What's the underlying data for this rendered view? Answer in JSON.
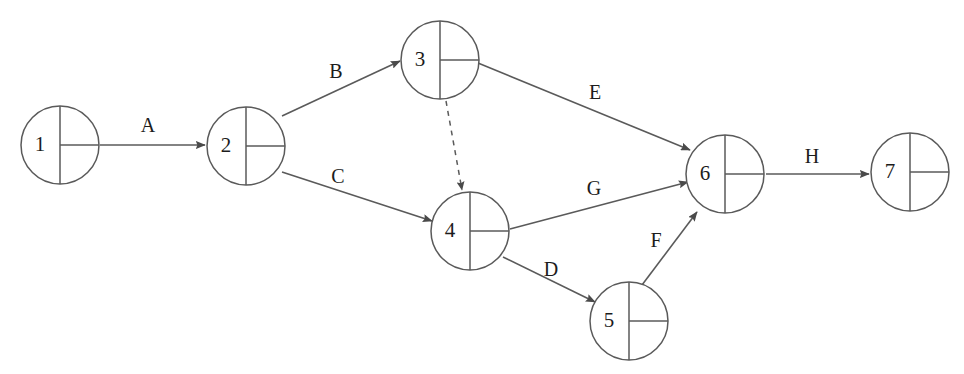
{
  "diagram": {
    "type": "activity-on-arrow-network",
    "background_color": "#ffffff",
    "stroke_color": "#5a5a5a",
    "text_color": "#1c1c1c",
    "nodes": [
      {
        "id": "1",
        "label": "1",
        "cx": 60,
        "cy": 145,
        "r": 39
      },
      {
        "id": "2",
        "label": "2",
        "cx": 246,
        "cy": 146,
        "r": 39
      },
      {
        "id": "3",
        "label": "3",
        "cx": 440,
        "cy": 60,
        "r": 39
      },
      {
        "id": "4",
        "label": "4",
        "cx": 470,
        "cy": 231,
        "r": 39
      },
      {
        "id": "5",
        "label": "5",
        "cx": 629,
        "cy": 321,
        "r": 39
      },
      {
        "id": "6",
        "label": "6",
        "cx": 725,
        "cy": 174,
        "r": 39
      },
      {
        "id": "7",
        "label": "7",
        "cx": 910,
        "cy": 172,
        "r": 39
      }
    ],
    "edges": [
      {
        "id": "A",
        "label": "A",
        "from": "1",
        "to": "2",
        "style": "solid",
        "x1": 100,
        "y1": 145,
        "x2": 205,
        "y2": 145,
        "label_x": 148,
        "label_y": 127
      },
      {
        "id": "B",
        "label": "B",
        "from": "2",
        "to": "3",
        "style": "solid",
        "x1": 282,
        "y1": 116,
        "x2": 400,
        "y2": 61,
        "label_x": 336,
        "label_y": 73
      },
      {
        "id": "C",
        "label": "C",
        "from": "2",
        "to": "4",
        "style": "solid",
        "x1": 282,
        "y1": 172,
        "x2": 432,
        "y2": 221,
        "label_x": 338,
        "label_y": 178
      },
      {
        "id": "dummy",
        "label": "",
        "from": "3",
        "to": "4",
        "style": "dashed",
        "x1": 446,
        "y1": 101,
        "x2": 462,
        "y2": 190,
        "label_x": 0,
        "label_y": 0
      },
      {
        "id": "E",
        "label": "E",
        "from": "3",
        "to": "6",
        "style": "solid",
        "x1": 478,
        "y1": 63,
        "x2": 690,
        "y2": 150,
        "label_x": 595,
        "label_y": 94
      },
      {
        "id": "G",
        "label": "G",
        "from": "4",
        "to": "6",
        "style": "solid",
        "x1": 510,
        "y1": 229,
        "x2": 688,
        "y2": 182,
        "label_x": 594,
        "label_y": 190
      },
      {
        "id": "D",
        "label": "D",
        "from": "4",
        "to": "5",
        "style": "solid",
        "x1": 503,
        "y1": 257,
        "x2": 595,
        "y2": 302,
        "label_x": 551,
        "label_y": 271
      },
      {
        "id": "F",
        "label": "F",
        "from": "5",
        "to": "6",
        "style": "solid",
        "x1": 642,
        "y1": 285,
        "x2": 697,
        "y2": 212,
        "label_x": 656,
        "label_y": 242
      },
      {
        "id": "H",
        "label": "H",
        "from": "6",
        "to": "7",
        "style": "solid",
        "x1": 766,
        "y1": 174,
        "x2": 869,
        "y2": 174,
        "label_x": 812,
        "label_y": 158
      }
    ]
  }
}
